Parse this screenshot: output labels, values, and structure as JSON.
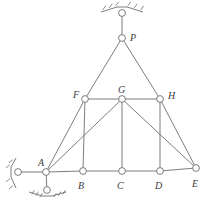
{
  "figure": {
    "kind": "static-truss-diagram",
    "stroke_color": "#6e6e6e",
    "node_fill": "#ffffff",
    "label_color": "#3c3c3c",
    "background": "#ffffff",
    "width": 219,
    "height": 203
  },
  "nodes": [
    {
      "id": "P",
      "label": "P",
      "x": 122,
      "y": 38,
      "label_x": 130,
      "label_y": 33
    },
    {
      "id": "F",
      "label": "F",
      "x": 85,
      "y": 99,
      "label_x": 73,
      "label_y": 90
    },
    {
      "id": "G",
      "label": "G",
      "x": 122,
      "y": 99,
      "label_x": 118,
      "label_y": 85
    },
    {
      "id": "H",
      "label": "H",
      "x": 160,
      "y": 99,
      "label_x": 168,
      "label_y": 91
    },
    {
      "id": "A",
      "label": "A",
      "x": 46,
      "y": 172,
      "label_x": 38,
      "label_y": 158
    },
    {
      "id": "B",
      "label": "B",
      "x": 83,
      "y": 171,
      "label_x": 78,
      "label_y": 181
    },
    {
      "id": "C",
      "label": "C",
      "x": 122,
      "y": 171,
      "label_x": 117,
      "label_y": 181
    },
    {
      "id": "D",
      "label": "D",
      "x": 160,
      "y": 171,
      "label_x": 155,
      "label_y": 181
    },
    {
      "id": "E",
      "label": "E",
      "x": 196,
      "y": 168,
      "label_x": 192,
      "label_y": 179
    }
  ],
  "members": [
    {
      "from": "P",
      "to": "F",
      "kind": "left-chord"
    },
    {
      "from": "F",
      "to": "A",
      "kind": "left-chord"
    },
    {
      "from": "P",
      "to": "H",
      "kind": "right-chord"
    },
    {
      "from": "H",
      "to": "E",
      "kind": "right-chord"
    },
    {
      "from": "F",
      "to": "G",
      "kind": "top-chord"
    },
    {
      "from": "G",
      "to": "H",
      "kind": "top-chord"
    },
    {
      "from": "A",
      "to": "B",
      "kind": "bottom-chord"
    },
    {
      "from": "B",
      "to": "C",
      "kind": "bottom-chord"
    },
    {
      "from": "C",
      "to": "D",
      "kind": "bottom-chord"
    },
    {
      "from": "D",
      "to": "E",
      "kind": "bottom-chord"
    },
    {
      "from": "F",
      "to": "B",
      "kind": "vertical"
    },
    {
      "from": "G",
      "to": "C",
      "kind": "vertical"
    },
    {
      "from": "H",
      "to": "D",
      "kind": "vertical"
    },
    {
      "from": "A",
      "to": "G",
      "kind": "diagonal"
    },
    {
      "from": "G",
      "to": "E",
      "kind": "diagonal"
    }
  ],
  "supports": [
    {
      "id": "top-support",
      "type": "pin-hanger",
      "pin_x": 122,
      "pin_y": 13,
      "connects_to": "P",
      "hatch_y": 7,
      "hatch_from_x": 101,
      "hatch_to_x": 143
    },
    {
      "id": "left-support",
      "type": "roller-horizontal",
      "pin_x": 18,
      "pin_y": 172,
      "connects_to": "A",
      "hatch_x": 11,
      "hatch_from_y": 158,
      "hatch_to_y": 188
    },
    {
      "id": "bottom-support",
      "type": "roller-vertical",
      "pin_x": 47,
      "pin_y": 190,
      "connects_to": "A",
      "hatch_y": 196,
      "hatch_from_x": 29,
      "hatch_to_x": 66
    }
  ]
}
